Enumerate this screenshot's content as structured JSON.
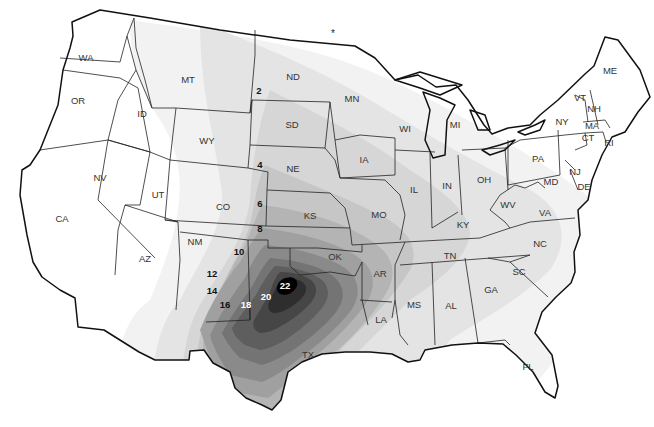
{
  "map": {
    "type": "contour-map",
    "region": "Contiguous United States",
    "colors": {
      "background": "#ffffff",
      "band_0_2": "#f2f2f2",
      "band_2_4": "#e4e4e4",
      "band_4_6": "#d6d6d6",
      "band_6_8": "#c6c6c6",
      "band_8_10": "#b4b4b4",
      "band_10_12": "#a0a0a0",
      "band_12_14": "#8a8a8a",
      "band_14_16": "#747474",
      "band_16_18": "#5e5e5e",
      "band_18_20": "#464646",
      "band_20_22": "#2e2e2e",
      "peak_22": "#000000",
      "outline": "#222222"
    },
    "marker": "*",
    "states": [
      {
        "abbr": "WA",
        "x": 86,
        "y": 58
      },
      {
        "abbr": "OR",
        "x": 78,
        "y": 101
      },
      {
        "abbr": "ID",
        "x": 142,
        "y": 114
      },
      {
        "abbr": "MT",
        "x": 188,
        "y": 80
      },
      {
        "abbr": "WY",
        "x": 207,
        "y": 141
      },
      {
        "abbr": "ND",
        "x": 293,
        "y": 77
      },
      {
        "abbr": "SD",
        "x": 292,
        "y": 125
      },
      {
        "abbr": "NE",
        "x": 293,
        "y": 169
      },
      {
        "abbr": "MN",
        "x": 352,
        "y": 99
      },
      {
        "abbr": "IA",
        "x": 364,
        "y": 160
      },
      {
        "abbr": "WI",
        "x": 405,
        "y": 129
      },
      {
        "abbr": "MI",
        "x": 455,
        "y": 125
      },
      {
        "abbr": "IL",
        "x": 414,
        "y": 190
      },
      {
        "abbr": "IN",
        "x": 447,
        "y": 186
      },
      {
        "abbr": "OH",
        "x": 484,
        "y": 180
      },
      {
        "abbr": "PA",
        "x": 538,
        "y": 159
      },
      {
        "abbr": "NY",
        "x": 562,
        "y": 122
      },
      {
        "abbr": "VT",
        "x": 580,
        "y": 98
      },
      {
        "abbr": "NH",
        "x": 594,
        "y": 109
      },
      {
        "abbr": "ME",
        "x": 610,
        "y": 71
      },
      {
        "abbr": "MA",
        "x": 592,
        "y": 126
      },
      {
        "abbr": "CT",
        "x": 588,
        "y": 138
      },
      {
        "abbr": "RI",
        "x": 609,
        "y": 143
      },
      {
        "abbr": "NJ",
        "x": 575,
        "y": 172
      },
      {
        "abbr": "DE",
        "x": 584,
        "y": 187
      },
      {
        "abbr": "MD",
        "x": 551,
        "y": 182
      },
      {
        "abbr": "WV",
        "x": 508,
        "y": 205
      },
      {
        "abbr": "VA",
        "x": 545,
        "y": 213
      },
      {
        "abbr": "KY",
        "x": 463,
        "y": 225
      },
      {
        "abbr": "NC",
        "x": 540,
        "y": 244
      },
      {
        "abbr": "TN",
        "x": 450,
        "y": 256
      },
      {
        "abbr": "SC",
        "x": 519,
        "y": 272
      },
      {
        "abbr": "GA",
        "x": 491,
        "y": 290
      },
      {
        "abbr": "AL",
        "x": 451,
        "y": 306
      },
      {
        "abbr": "MS",
        "x": 414,
        "y": 305
      },
      {
        "abbr": "AR",
        "x": 380,
        "y": 274
      },
      {
        "abbr": "LA",
        "x": 381,
        "y": 320
      },
      {
        "abbr": "MO",
        "x": 379,
        "y": 215
      },
      {
        "abbr": "KS",
        "x": 310,
        "y": 216
      },
      {
        "abbr": "OK",
        "x": 335,
        "y": 257
      },
      {
        "abbr": "TX",
        "x": 308,
        "y": 355
      },
      {
        "abbr": "CO",
        "x": 223,
        "y": 207
      },
      {
        "abbr": "NM",
        "x": 195,
        "y": 242
      },
      {
        "abbr": "AZ",
        "x": 145,
        "y": 259
      },
      {
        "abbr": "UT",
        "x": 158,
        "y": 195
      },
      {
        "abbr": "NV",
        "x": 100,
        "y": 178
      },
      {
        "abbr": "CA",
        "x": 62,
        "y": 219
      },
      {
        "abbr": "FL",
        "x": 528,
        "y": 367
      }
    ],
    "contour_labels": [
      {
        "value": "2",
        "x": 259,
        "y": 91,
        "color": "dark"
      },
      {
        "value": "4",
        "x": 260,
        "y": 165,
        "color": "dark"
      },
      {
        "value": "6",
        "x": 260,
        "y": 204,
        "color": "dark"
      },
      {
        "value": "8",
        "x": 260,
        "y": 229,
        "color": "dark"
      },
      {
        "value": "10",
        "x": 239,
        "y": 252,
        "color": "dark"
      },
      {
        "value": "12",
        "x": 212,
        "y": 274,
        "color": "dark"
      },
      {
        "value": "14",
        "x": 212,
        "y": 291,
        "color": "dark"
      },
      {
        "value": "16",
        "x": 225,
        "y": 305,
        "color": "dark"
      },
      {
        "value": "18",
        "x": 246,
        "y": 305,
        "color": "light"
      },
      {
        "value": "20",
        "x": 266,
        "y": 297,
        "color": "light"
      },
      {
        "value": "22",
        "x": 285,
        "y": 286,
        "color": "light"
      }
    ]
  }
}
